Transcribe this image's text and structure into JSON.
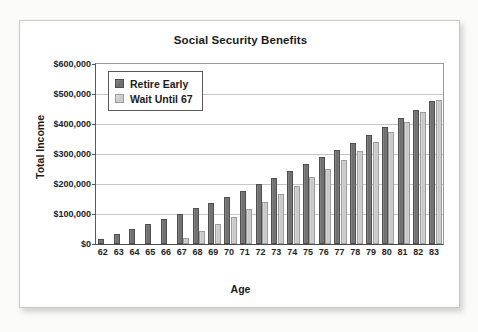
{
  "chart_data": {
    "type": "bar",
    "title": "Social Security Benefits",
    "xlabel": "Age",
    "ylabel": "Total Income",
    "categories": [
      "62",
      "63",
      "64",
      "65",
      "66",
      "67",
      "68",
      "69",
      "70",
      "71",
      "72",
      "73",
      "74",
      "75",
      "76",
      "77",
      "78",
      "79",
      "80",
      "81",
      "82",
      "83"
    ],
    "ylim": [
      0,
      600000
    ],
    "ytick_values": [
      0,
      100000,
      200000,
      300000,
      400000,
      500000,
      600000
    ],
    "ytick_labels": [
      "$0",
      "$100,000",
      "$200,000",
      "$300,000",
      "$400,000",
      "$500,000",
      "$600,000"
    ],
    "grid": true,
    "legend_position": "upper left",
    "series": [
      {
        "name": "Retire Early",
        "color": "#6f6f6f",
        "values": [
          17000,
          33000,
          50000,
          67000,
          84000,
          101000,
          119000,
          136000,
          158000,
          177000,
          199000,
          221000,
          244000,
          266000,
          290000,
          314000,
          338000,
          364000,
          391000,
          419000,
          447000,
          477000
        ]
      },
      {
        "name": "Wait Until 67",
        "color": "#c9c9c9",
        "values": [
          0,
          0,
          0,
          0,
          0,
          20000,
          43000,
          66000,
          91000,
          116000,
          141000,
          168000,
          194000,
          222000,
          251000,
          280000,
          310000,
          341000,
          374000,
          407000,
          441000,
          479000
        ]
      }
    ]
  },
  "chart": {
    "title": "Social Security Benefits",
    "x_axis_title": "Age",
    "y_axis_title": "Total Income",
    "legend": [
      {
        "label": "Retire Early",
        "swatch": "dark-gray-swatch"
      },
      {
        "label": "Wait Until 67",
        "swatch": "light-gray-swatch"
      }
    ],
    "colors": {
      "series_early": "#6f6f6f",
      "series_wait": "#c9c9c9",
      "gridline": "#c4c4c4",
      "axis": "#4a4a4a",
      "text": "#1b1b1b",
      "card_background": "#ffffff",
      "page_background": "#fbfbfa"
    }
  }
}
